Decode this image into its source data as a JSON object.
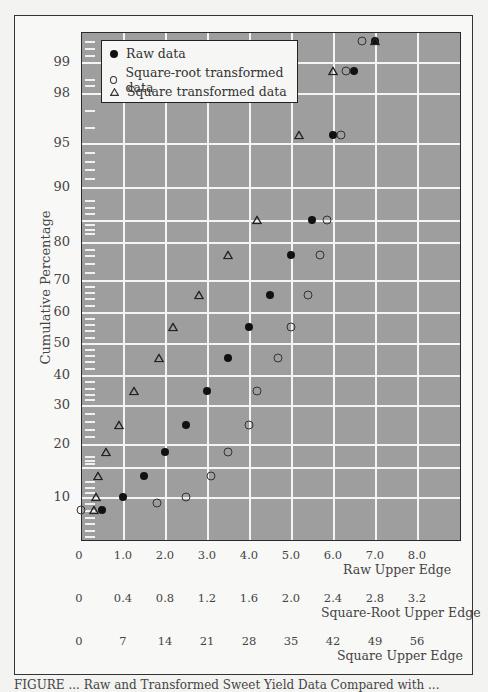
{
  "chart_data": {
    "type": "scatter",
    "title": "",
    "ylabel": "Cumulative Percentage",
    "y_scale": "normal-probability",
    "y_ticks": [
      10,
      20,
      30,
      40,
      50,
      60,
      70,
      80,
      90,
      95,
      98,
      99
    ],
    "x_axes": [
      {
        "label": "Raw Upper Edge",
        "ticks": [
          "0",
          "1.0",
          "2.0",
          "3.0",
          "4.0",
          "5.0",
          "6.0",
          "7.0",
          "8.0"
        ]
      },
      {
        "label": "Square-Root Upper Edge",
        "ticks": [
          "0",
          "0.4",
          "0.8",
          "1.2",
          "1.6",
          "2.0",
          "2.4",
          "2.8",
          "3.2"
        ]
      },
      {
        "label": "Square Upper Edge",
        "ticks": [
          "0",
          "7",
          "14",
          "21",
          "28",
          "35",
          "42",
          "49",
          "56"
        ]
      }
    ],
    "xlim": [
      0,
      9
    ],
    "grid": true,
    "legend_position": "upper-left",
    "series": [
      {
        "name": "Raw data",
        "marker": "filled-circle",
        "points": [
          [
            0.5,
            8
          ],
          [
            1.0,
            10
          ],
          [
            1.5,
            14
          ],
          [
            2.0,
            19
          ],
          [
            2.5,
            25
          ],
          [
            3.0,
            35
          ],
          [
            3.5,
            45
          ],
          [
            4.0,
            55
          ],
          [
            4.5,
            65
          ],
          [
            5.0,
            76
          ],
          [
            5.5,
            85
          ],
          [
            6.0,
            95.5
          ],
          [
            6.5,
            98.8
          ],
          [
            7.0,
            99.6
          ]
        ]
      },
      {
        "name": "Square-root transformed data",
        "marker": "open-circle",
        "points": [
          [
            0.0,
            8
          ],
          [
            1.8,
            9
          ],
          [
            2.5,
            10
          ],
          [
            3.1,
            14
          ],
          [
            3.5,
            19
          ],
          [
            4.0,
            25
          ],
          [
            4.2,
            35
          ],
          [
            4.7,
            45
          ],
          [
            5.0,
            55
          ],
          [
            5.4,
            65
          ],
          [
            5.7,
            76
          ],
          [
            5.85,
            85
          ],
          [
            6.2,
            95.5
          ],
          [
            6.3,
            98.8
          ],
          [
            6.7,
            99.6
          ]
        ]
      },
      {
        "name": "Square transformed data",
        "marker": "open-triangle",
        "points": [
          [
            0.3,
            8
          ],
          [
            0.35,
            10
          ],
          [
            0.4,
            14
          ],
          [
            0.6,
            19
          ],
          [
            0.9,
            25
          ],
          [
            1.25,
            35
          ],
          [
            1.85,
            45
          ],
          [
            2.2,
            55
          ],
          [
            2.8,
            65
          ],
          [
            3.5,
            76
          ],
          [
            4.2,
            85
          ],
          [
            5.2,
            95.5
          ],
          [
            6.0,
            98.8
          ],
          [
            7.0,
            99.6
          ]
        ]
      }
    ]
  },
  "axes": {
    "y_title": "Cumulative Percentage",
    "y_labels": [
      {
        "text": "99",
        "y": 62
      },
      {
        "text": "98",
        "y": 93
      },
      {
        "text": "95",
        "y": 143
      },
      {
        "text": "90",
        "y": 187
      },
      {
        "text": "80",
        "y": 242
      },
      {
        "text": "70",
        "y": 280
      },
      {
        "text": "60",
        "y": 312
      },
      {
        "text": "50",
        "y": 343
      },
      {
        "text": "40",
        "y": 375
      },
      {
        "text": "30",
        "y": 405
      },
      {
        "text": "20",
        "y": 444
      },
      {
        "text": "10",
        "y": 497
      }
    ],
    "raw_title": "Raw Upper Edge",
    "sqrt_title": "Square-Root Upper Edge",
    "square_title": "Square Upper Edge",
    "raw_ticks": [
      "0",
      "1.0",
      "2.0",
      "3.0",
      "4.0",
      "5.0",
      "6.0",
      "7.0",
      "8.0"
    ],
    "sqrt_ticks": [
      "0",
      "0.4",
      "0.8",
      "1.2",
      "1.6",
      "2.0",
      "2.4",
      "2.8",
      "3.2"
    ],
    "square_ticks": [
      "0",
      "7",
      "14",
      "21",
      "28",
      "35",
      "42",
      "49",
      "56"
    ]
  },
  "legend": {
    "raw": "Raw data",
    "sqrt": "Square-root transformed data",
    "square": "Square transformed data"
  },
  "caption": "FIGURE  ...  Raw and Transformed Sweet Yield Data Compared with ..."
}
